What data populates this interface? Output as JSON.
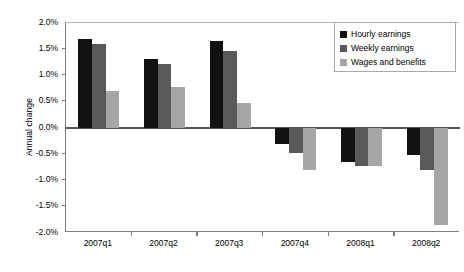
{
  "chart_data": {
    "type": "bar",
    "title": "",
    "xlabel": "",
    "ylabel": "Annual change",
    "categories": [
      "2007q1",
      "2007q2",
      "2007q3",
      "2007q4",
      "2008q1",
      "2008q2"
    ],
    "series": [
      {
        "name": "Hourly earnings",
        "color": "#111111",
        "values": [
          1.7,
          1.32,
          1.65,
          -0.3,
          -0.65,
          -0.52
        ]
      },
      {
        "name": "Weekly earnings",
        "color": "#595959",
        "values": [
          1.6,
          1.22,
          1.46,
          -0.47,
          -0.72,
          -0.8
        ]
      },
      {
        "name": "Wages and benefits",
        "color": "#a6a6a6",
        "values": [
          0.7,
          0.78,
          0.47,
          -0.8,
          -0.72,
          -1.85
        ]
      }
    ],
    "ylim": [
      -2.0,
      2.0
    ],
    "yticks": [
      "2.0%",
      "1.5%",
      "1.0%",
      "0.5%",
      "0.0%",
      "-0.5%",
      "-1.0%",
      "-1.5%",
      "-2.0%"
    ],
    "ytick_values": [
      2.0,
      1.5,
      1.0,
      0.5,
      0.0,
      -0.5,
      -1.0,
      -1.5,
      -2.0
    ],
    "grid": false,
    "legend_position": "top-right",
    "axis_color": "#808080",
    "background": "#ffffff"
  }
}
